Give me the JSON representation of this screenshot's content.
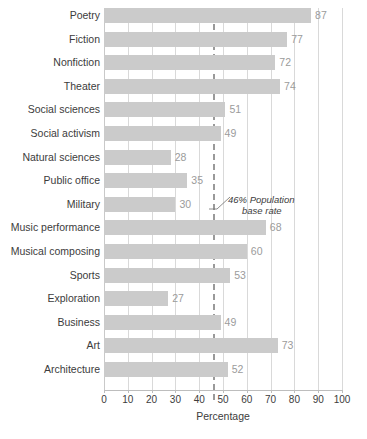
{
  "chart_data": {
    "type": "bar",
    "orientation": "horizontal",
    "title": "",
    "xlabel": "Percentage",
    "ylabel": "",
    "xlim": [
      0,
      100
    ],
    "xticks": [
      0,
      10,
      20,
      30,
      40,
      50,
      60,
      70,
      80,
      90,
      100
    ],
    "grid": true,
    "legend": null,
    "categories": [
      "Poetry",
      "Fiction",
      "Nonfiction",
      "Theater",
      "Social sciences",
      "Social activism",
      "Natural sciences",
      "Public office",
      "Military",
      "Music performance",
      "Musical composing",
      "Sports",
      "Exploration",
      "Business",
      "Art",
      "Architecture"
    ],
    "values": [
      87,
      77,
      72,
      74,
      51,
      49,
      28,
      35,
      30,
      68,
      60,
      53,
      27,
      49,
      73,
      52
    ],
    "reference_line": {
      "value": 46,
      "style": "dashed",
      "label_line_1": "46% Population",
      "label_line_2": "base rate"
    },
    "colors": {
      "bar": "#cbcbcb",
      "value_label": "#9b9b9b",
      "gridline": "#d9d9d9",
      "reference_line": "#9a9a9a",
      "text": "#3c3c3c"
    }
  }
}
